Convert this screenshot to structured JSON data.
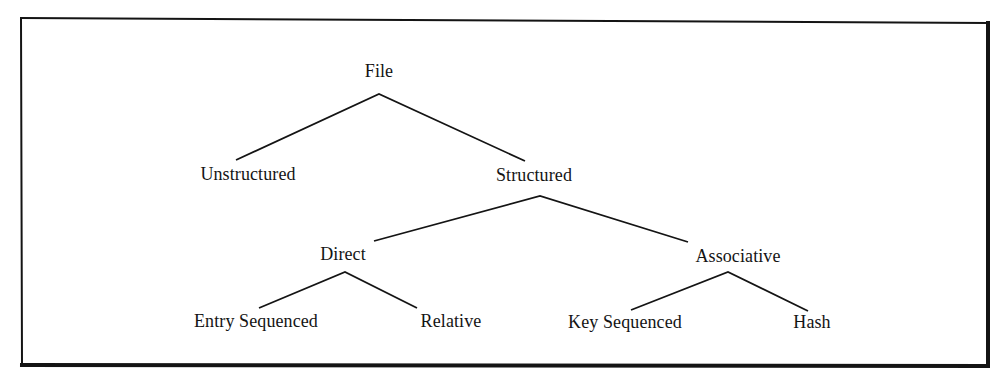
{
  "diagram": {
    "type": "tree",
    "title": "",
    "colors": {
      "background": "#ffffff",
      "ink": "#141414"
    },
    "nodes": [
      {
        "id": "file",
        "label": "File",
        "x": 379,
        "y": 72
      },
      {
        "id": "unstructured",
        "label": "Unstructured",
        "x": 248,
        "y": 175
      },
      {
        "id": "structured",
        "label": "Structured",
        "x": 534,
        "y": 176
      },
      {
        "id": "direct",
        "label": "Direct",
        "x": 343,
        "y": 255
      },
      {
        "id": "associative",
        "label": "Associative",
        "x": 738,
        "y": 257
      },
      {
        "id": "entry_sequenced",
        "label": "Entry Sequenced",
        "x": 256,
        "y": 322
      },
      {
        "id": "relative",
        "label": "Relative",
        "x": 451,
        "y": 322
      },
      {
        "id": "key_sequenced",
        "label": "Key Sequenced",
        "x": 625,
        "y": 322
      },
      {
        "id": "hash",
        "label": "Hash",
        "x": 812,
        "y": 322
      }
    ],
    "edges": [
      {
        "from": "file",
        "to": "unstructured"
      },
      {
        "from": "file",
        "to": "structured"
      },
      {
        "from": "structured",
        "to": "direct"
      },
      {
        "from": "structured",
        "to": "associative"
      },
      {
        "from": "direct",
        "to": "entry_sequenced"
      },
      {
        "from": "direct",
        "to": "relative"
      },
      {
        "from": "associative",
        "to": "key_sequenced"
      },
      {
        "from": "associative",
        "to": "hash"
      }
    ]
  },
  "labels": {
    "file": "File",
    "unstructured": "Unstructured",
    "structured": "Structured",
    "direct": "Direct",
    "associative": "Associative",
    "entry_sequenced": "Entry Sequenced",
    "relative": "Relative",
    "key_sequenced": "Key Sequenced",
    "hash": "Hash"
  }
}
